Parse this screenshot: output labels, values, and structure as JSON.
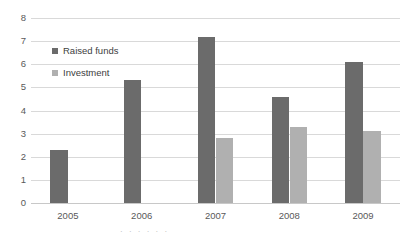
{
  "chart_data": {
    "type": "bar",
    "title": "",
    "subtitle": "",
    "xlabel": "",
    "ylabel": "",
    "categories": [
      "2005",
      "2006",
      "2007",
      "2008",
      "2009"
    ],
    "series": [
      {
        "name": "Raised funds",
        "color": "#6b6b6b",
        "values": [
          2.3,
          5.3,
          7.2,
          4.6,
          6.1
        ]
      },
      {
        "name": "Investment",
        "color": "#b0b0b0",
        "values": [
          null,
          null,
          2.8,
          3.3,
          3.1
        ]
      }
    ],
    "ylim": [
      0,
      8
    ],
    "yticks": [
      "0",
      "1",
      "2",
      "3",
      "4",
      "5",
      "6",
      "7",
      "8"
    ],
    "grid": true,
    "legend_position": "inside-upper-left",
    "gridline_color": "#d9d9d9",
    "background": "#ffffff"
  },
  "legend": {
    "items": [
      {
        "label": "Raised funds",
        "marker": "square-marker"
      },
      {
        "label": "Investment",
        "marker": "square-marker"
      }
    ]
  },
  "caption": {
    "clipped_text": "· · · · · ·"
  }
}
